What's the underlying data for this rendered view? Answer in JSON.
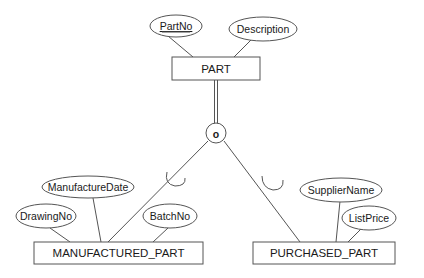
{
  "diagram": {
    "type": "EER specialization",
    "superclass": {
      "name": "PART",
      "attributes": [
        {
          "label": "PartNo",
          "key": true
        },
        {
          "label": "Description",
          "key": false
        }
      ]
    },
    "specialization": {
      "symbol": "o",
      "meaning": "overlapping",
      "participation": "total"
    },
    "subclasses": [
      {
        "name": "MANUFACTURED_PART",
        "attributes": [
          {
            "label": "ManufactureDate"
          },
          {
            "label": "DrawingNo"
          },
          {
            "label": "BatchNo"
          }
        ]
      },
      {
        "name": "PURCHASED_PART",
        "attributes": [
          {
            "label": "SupplierName"
          },
          {
            "label": "ListPrice"
          }
        ]
      }
    ]
  },
  "colors": {
    "stroke": "#555555",
    "text": "#1a1a1a",
    "background": "#ffffff"
  }
}
